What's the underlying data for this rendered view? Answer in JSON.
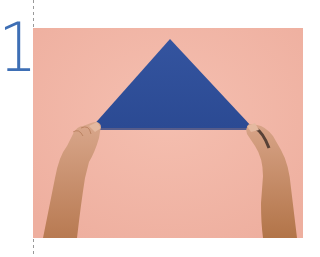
{
  "step": {
    "number": "1"
  },
  "illustration": {
    "description": "Hands holding the bottom corners of a blue napkin folded into a triangle on a pink surface",
    "colors": {
      "background": "#f2b7a8",
      "napkin": "#2f4f9a",
      "numeral": "#3e6fb5",
      "skin": "#c89068"
    }
  }
}
